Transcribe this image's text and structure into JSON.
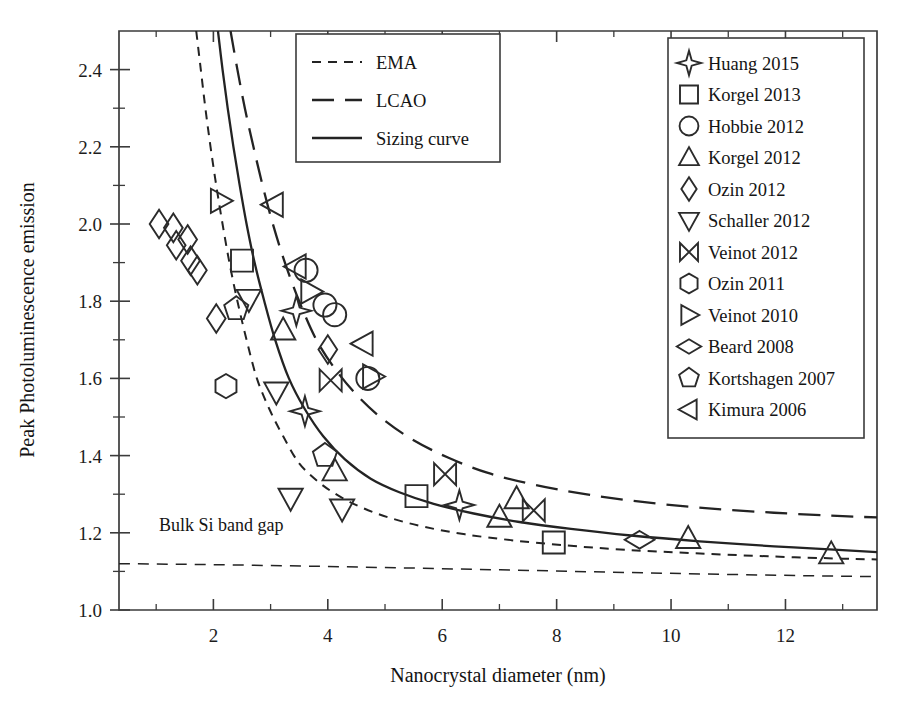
{
  "chart_data": {
    "type": "scatter",
    "title": "",
    "xlabel": "Nanocrystal diameter (nm)",
    "ylabel": "Peak Photoluminescence emission",
    "xlim": [
      0.35,
      13.6
    ],
    "ylim": [
      1.0,
      2.5
    ],
    "grid": false,
    "x_ticks_major": [
      2,
      4,
      6,
      8,
      10,
      12
    ],
    "x_ticks_minor": [
      1,
      3,
      5,
      7,
      9,
      11,
      13
    ],
    "y_ticks_major": [
      1.0,
      1.2,
      1.4,
      1.6,
      1.8,
      2.0,
      2.2,
      2.4
    ],
    "y_ticks_minor": [
      1.1,
      1.3,
      1.5,
      1.7,
      1.9,
      2.1,
      2.3
    ],
    "x_tick_labels": [
      "2",
      "4",
      "6",
      "8",
      "10",
      "12"
    ],
    "y_tick_labels": [
      "1.0",
      "1.2",
      "1.4",
      "1.6",
      "1.8",
      "2.0",
      "2.2",
      "2.4"
    ],
    "annotations": [
      {
        "text": "Bulk Si band gap",
        "x": 1.05,
        "y": 1.205
      }
    ],
    "bulk_si_band_gap": 1.12,
    "curve_legend": {
      "position": "top-center",
      "entries": [
        {
          "label": "EMA",
          "style": "short-dash"
        },
        {
          "label": "LCAO",
          "style": "long-dash"
        },
        {
          "label": "Sizing curve",
          "style": "solid"
        }
      ]
    },
    "marker_legend": {
      "position": "top-right",
      "entries": [
        {
          "label": "Huang 2015",
          "marker": "star4"
        },
        {
          "label": "Korgel 2013",
          "marker": "square"
        },
        {
          "label": "Hobbie 2012",
          "marker": "circle"
        },
        {
          "label": "Korgel 2012",
          "marker": "triangle-up"
        },
        {
          "label": "Ozin 2012",
          "marker": "diamond-tall"
        },
        {
          "label": "Schaller 2012",
          "marker": "triangle-down"
        },
        {
          "label": "Veinot 2012",
          "marker": "bowtie"
        },
        {
          "label": "Ozin 2011",
          "marker": "hexagon"
        },
        {
          "label": "Veinot 2010",
          "marker": "triangle-right"
        },
        {
          "label": "Beard 2008",
          "marker": "diamond-wide"
        },
        {
          "label": "Kortshagen 2007",
          "marker": "pentagon"
        },
        {
          "label": "Kimura 2006",
          "marker": "triangle-left"
        }
      ]
    },
    "curves": [
      {
        "name": "EMA",
        "style": "short-dash",
        "points": [
          [
            1.7,
            2.5
          ],
          [
            1.78,
            2.4
          ],
          [
            1.86,
            2.3
          ],
          [
            1.95,
            2.2
          ],
          [
            2.05,
            2.1
          ],
          [
            2.16,
            2.0
          ],
          [
            2.28,
            1.9
          ],
          [
            2.42,
            1.8
          ],
          [
            2.58,
            1.7
          ],
          [
            2.76,
            1.6
          ],
          [
            2.98,
            1.52
          ],
          [
            3.22,
            1.45
          ],
          [
            3.5,
            1.38
          ],
          [
            3.85,
            1.33
          ],
          [
            4.2,
            1.295
          ],
          [
            4.6,
            1.265
          ],
          [
            5.1,
            1.238
          ],
          [
            5.7,
            1.215
          ],
          [
            6.4,
            1.196
          ],
          [
            7.2,
            1.181
          ],
          [
            8.1,
            1.168
          ],
          [
            9.2,
            1.156
          ],
          [
            10.4,
            1.147
          ],
          [
            11.7,
            1.139
          ],
          [
            13.0,
            1.133
          ],
          [
            13.6,
            1.131
          ]
        ]
      },
      {
        "name": "Sizing curve",
        "style": "solid",
        "points": [
          [
            2.08,
            2.5
          ],
          [
            2.16,
            2.4
          ],
          [
            2.25,
            2.3
          ],
          [
            2.35,
            2.2
          ],
          [
            2.46,
            2.1
          ],
          [
            2.58,
            2.0
          ],
          [
            2.72,
            1.9
          ],
          [
            2.89,
            1.8
          ],
          [
            3.08,
            1.7
          ],
          [
            3.32,
            1.6
          ],
          [
            3.6,
            1.52
          ],
          [
            3.92,
            1.45
          ],
          [
            4.3,
            1.39
          ],
          [
            4.75,
            1.34
          ],
          [
            5.25,
            1.305
          ],
          [
            5.85,
            1.275
          ],
          [
            6.55,
            1.25
          ],
          [
            7.35,
            1.228
          ],
          [
            8.25,
            1.21
          ],
          [
            9.3,
            1.193
          ],
          [
            10.5,
            1.178
          ],
          [
            11.8,
            1.165
          ],
          [
            13.0,
            1.155
          ],
          [
            13.6,
            1.15
          ]
        ]
      },
      {
        "name": "LCAO",
        "style": "long-dash",
        "points": [
          [
            2.3,
            2.5
          ],
          [
            2.42,
            2.4
          ],
          [
            2.55,
            2.3
          ],
          [
            2.7,
            2.2
          ],
          [
            2.86,
            2.1
          ],
          [
            3.04,
            2.0
          ],
          [
            3.25,
            1.9
          ],
          [
            3.5,
            1.8
          ],
          [
            3.8,
            1.7
          ],
          [
            4.15,
            1.62
          ],
          [
            4.55,
            1.55
          ],
          [
            5.0,
            1.49
          ],
          [
            5.5,
            1.44
          ],
          [
            6.1,
            1.395
          ],
          [
            6.8,
            1.355
          ],
          [
            7.6,
            1.325
          ],
          [
            8.5,
            1.3
          ],
          [
            9.5,
            1.28
          ],
          [
            10.6,
            1.264
          ],
          [
            11.8,
            1.252
          ],
          [
            13.0,
            1.243
          ],
          [
            13.6,
            1.24
          ]
        ]
      }
    ],
    "series": [
      {
        "name": "Huang 2015",
        "marker": "star4",
        "points": [
          [
            3.45,
            1.775
          ],
          [
            3.6,
            1.515
          ],
          [
            6.3,
            1.272
          ]
        ]
      },
      {
        "name": "Korgel 2013",
        "marker": "square",
        "points": [
          [
            2.5,
            1.905
          ],
          [
            5.55,
            1.295
          ],
          [
            7.95,
            1.175
          ]
        ]
      },
      {
        "name": "Hobbie 2012",
        "marker": "circle",
        "points": [
          [
            3.62,
            1.88
          ],
          [
            3.95,
            1.79
          ],
          [
            4.12,
            1.765
          ],
          [
            4.7,
            1.6
          ]
        ]
      },
      {
        "name": "Korgel 2012",
        "marker": "triangle-up",
        "points": [
          [
            3.22,
            1.725
          ],
          [
            4.12,
            1.36
          ],
          [
            7.0,
            1.24
          ],
          [
            7.3,
            1.288
          ],
          [
            10.3,
            1.185
          ],
          [
            12.8,
            1.145
          ]
        ]
      },
      {
        "name": "Ozin 2012",
        "marker": "diamond-tall",
        "points": [
          [
            1.05,
            2.0
          ],
          [
            1.3,
            1.99
          ],
          [
            1.35,
            1.945
          ],
          [
            1.55,
            1.96
          ],
          [
            1.6,
            1.905
          ],
          [
            1.72,
            1.88
          ],
          [
            2.05,
            1.755
          ],
          [
            4.0,
            1.675
          ]
        ]
      },
      {
        "name": "Schaller 2012",
        "marker": "triangle-down",
        "points": [
          [
            2.62,
            1.805
          ],
          [
            3.1,
            1.565
          ],
          [
            3.35,
            1.29
          ],
          [
            4.25,
            1.262
          ]
        ]
      },
      {
        "name": "Veinot 2012",
        "marker": "bowtie",
        "points": [
          [
            4.05,
            1.595
          ],
          [
            6.05,
            1.352
          ],
          [
            7.6,
            1.258
          ]
        ]
      },
      {
        "name": "Ozin 2011",
        "marker": "hexagon",
        "points": [
          [
            2.22,
            1.58
          ]
        ]
      },
      {
        "name": "Veinot 2010",
        "marker": "triangle-right",
        "points": [
          [
            2.12,
            2.06
          ],
          [
            3.7,
            1.825
          ],
          [
            4.78,
            1.605
          ]
        ]
      },
      {
        "name": "Beard 2008",
        "marker": "diamond-wide",
        "points": [
          [
            9.45,
            1.182
          ]
        ]
      },
      {
        "name": "Kortshagen 2007",
        "marker": "pentagon",
        "points": [
          [
            2.4,
            1.78
          ],
          [
            3.95,
            1.4
          ]
        ]
      },
      {
        "name": "Kimura 2006",
        "marker": "triangle-left",
        "points": [
          [
            3.05,
            2.05
          ],
          [
            3.45,
            1.89
          ],
          [
            4.62,
            1.69
          ]
        ]
      }
    ]
  }
}
